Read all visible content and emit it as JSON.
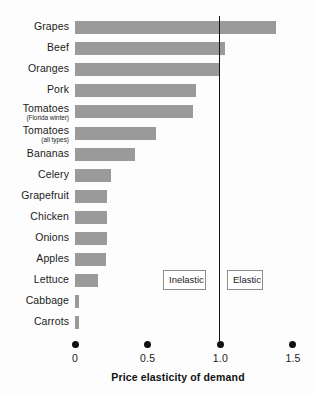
{
  "chart_data": {
    "type": "bar",
    "orientation": "horizontal",
    "title": "",
    "xlabel": "Price elasticity of demand",
    "ylabel": "",
    "xlim": [
      0,
      1.5
    ],
    "xticks": [
      0,
      0.5,
      1.0,
      1.5
    ],
    "xtick_labels": [
      "0",
      "0.5",
      "1.0",
      "1.5"
    ],
    "grid": false,
    "legend": false,
    "bar_color": "#9a9a9a",
    "reference_line": {
      "value": 1.0,
      "color": "#141414",
      "label_left": "Inelastic",
      "label_right": "Elastic"
    },
    "categories": [
      "Grapes",
      "Beef",
      "Oranges",
      "Pork",
      "Tomatoes (Florida winter)",
      "Tomatoes (all types)",
      "Bananas",
      "Celery",
      "Grapefruit",
      "Chicken",
      "Onions",
      "Apples",
      "Lettuce",
      "Cabbage",
      "Carrots"
    ],
    "values": [
      1.38,
      1.03,
      0.99,
      0.83,
      0.81,
      0.56,
      0.41,
      0.25,
      0.22,
      0.22,
      0.22,
      0.21,
      0.16,
      0.03,
      0.03
    ]
  },
  "rows": [
    {
      "label": "Grapes",
      "sub": "",
      "value": 1.38
    },
    {
      "label": "Beef",
      "sub": "",
      "value": 1.03
    },
    {
      "label": "Oranges",
      "sub": "",
      "value": 0.99
    },
    {
      "label": "Pork",
      "sub": "",
      "value": 0.83
    },
    {
      "label": "Tomatoes",
      "sub": "(Florida winter)",
      "value": 0.81
    },
    {
      "label": "Tomatoes",
      "sub": "(all types)",
      "value": 0.56
    },
    {
      "label": "Bananas",
      "sub": "",
      "value": 0.41
    },
    {
      "label": "Celery",
      "sub": "",
      "value": 0.25
    },
    {
      "label": "Grapefruit",
      "sub": "",
      "value": 0.22
    },
    {
      "label": "Chicken",
      "sub": "",
      "value": 0.22
    },
    {
      "label": "Onions",
      "sub": "",
      "value": 0.22
    },
    {
      "label": "Apples",
      "sub": "",
      "value": 0.21
    },
    {
      "label": "Lettuce",
      "sub": "",
      "value": 0.16
    },
    {
      "label": "Cabbage",
      "sub": "",
      "value": 0.03
    },
    {
      "label": "Carrots",
      "sub": "",
      "value": 0.03
    }
  ],
  "zones": {
    "inelastic": "Inelastic",
    "elastic": "Elastic"
  },
  "axis": {
    "title": "Price elasticity of demand",
    "ticks": [
      {
        "value": 0,
        "label": "0"
      },
      {
        "value": 0.5,
        "label": "0.5"
      },
      {
        "value": 1.0,
        "label": "1.0"
      },
      {
        "value": 1.5,
        "label": "1.5"
      }
    ]
  }
}
